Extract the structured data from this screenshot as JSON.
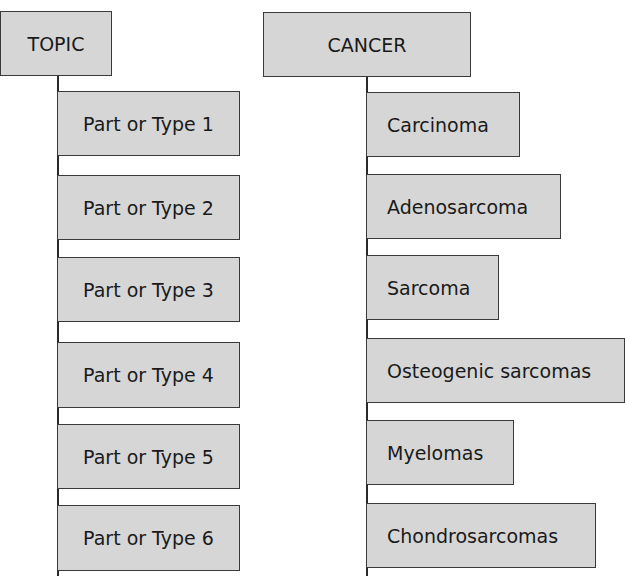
{
  "diagrams": [
    {
      "root": "TOPIC",
      "children": [
        "Part or Type 1",
        "Part or Type 2",
        "Part or Type 3",
        "Part or Type 4",
        "Part or Type 5",
        "Part or Type 6"
      ]
    },
    {
      "root": "CANCER",
      "children": [
        "Carcinoma",
        "Adenosarcoma",
        "Sarcoma",
        "Osteogenic sarcomas",
        "Myelomas",
        "Chondrosarcomas"
      ]
    }
  ],
  "colors": {
    "box_fill": "#d6d6d6",
    "border": "#3a3a3a",
    "line": "#2a2a2a"
  }
}
